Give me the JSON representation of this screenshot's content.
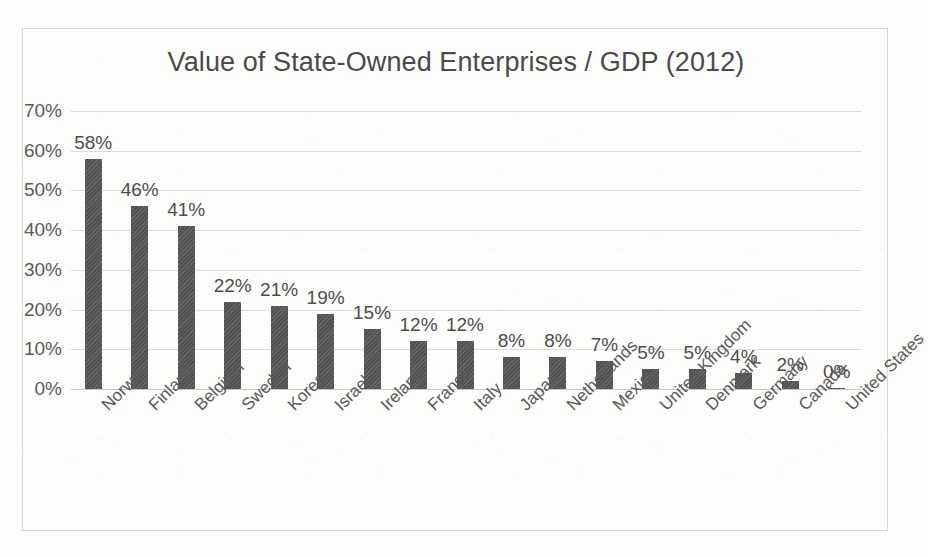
{
  "chart_data": {
    "type": "bar",
    "title": "Value of State-Owned Enterprises / GDP (2012)",
    "xlabel": "",
    "ylabel": "",
    "ylim": [
      0,
      70
    ],
    "ytick_labels": [
      "0%",
      "10%",
      "20%",
      "30%",
      "40%",
      "50%",
      "60%",
      "70%"
    ],
    "ytick_values": [
      0,
      10,
      20,
      30,
      40,
      50,
      60,
      70
    ],
    "grid": true,
    "legend": false,
    "value_suffix": "%",
    "bar_color": "#565656",
    "gridline_color": "#dcdcdc",
    "categories": [
      "Norway",
      "Finland",
      "Belgium",
      "Sweden",
      "Korea",
      "Israel",
      "Ireland",
      "France",
      "Italy",
      "Japan",
      "Netherlands",
      "Mexico",
      "United Kingdom",
      "Denmark",
      "Germany",
      "Canada",
      "United States"
    ],
    "values": [
      58,
      46,
      41,
      22,
      21,
      19,
      15,
      12,
      12,
      8,
      8,
      7,
      5,
      5,
      4,
      2,
      0
    ],
    "data_labels": [
      "58%",
      "46%",
      "41%",
      "22%",
      "21%",
      "19%",
      "15%",
      "12%",
      "12%",
      "8%",
      "8%",
      "7%",
      "5%",
      "5%",
      "4%",
      "2%",
      "0%"
    ]
  }
}
